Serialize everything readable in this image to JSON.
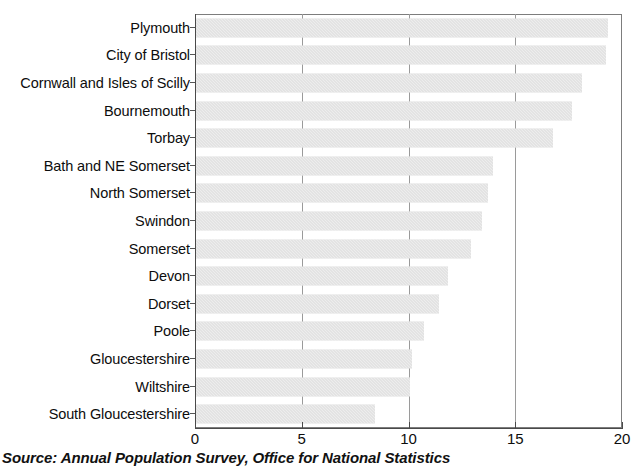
{
  "chart_data": {
    "type": "bar",
    "orientation": "horizontal",
    "title": "",
    "subtitle": "",
    "xlabel": "",
    "ylabel": "",
    "xlim": [
      0,
      20
    ],
    "xticks": [
      0,
      5,
      10,
      15,
      20
    ],
    "xtick_labels": [
      "0",
      "5",
      "10",
      "15",
      "20"
    ],
    "grid": "vertical gridlines at 5, 10, 15",
    "legend": "none",
    "bar_color": "#d8d8d8",
    "categories": [
      "Plymouth",
      "City of Bristol",
      "Cornwall and Isles of Scilly",
      "Bournemouth",
      "Torbay",
      "Bath and NE Somerset",
      "North Somerset",
      "Swindon",
      "Somerset",
      "Devon",
      "Dorset",
      "Poole",
      "Gloucestershire",
      "Wiltshire",
      "South Gloucestershire"
    ],
    "values": [
      19.3,
      19.2,
      18.1,
      17.6,
      16.7,
      13.9,
      13.7,
      13.4,
      12.9,
      11.8,
      11.4,
      10.7,
      10.1,
      10.0,
      8.4
    ]
  },
  "source": {
    "note": "Source: Annual Population Survey, Office for National Statistics"
  }
}
